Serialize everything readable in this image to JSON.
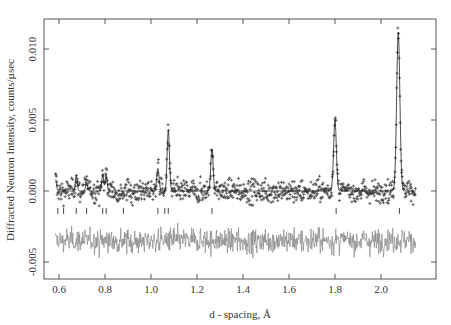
{
  "chart_data": {
    "type": "scatter",
    "title": "",
    "xlabel": "d - spacing, Å",
    "ylabel": "Diffracted Neutron Intensity, counts/µsec",
    "xlim": [
      0.57,
      2.18
    ],
    "ylim": [
      -0.0062,
      0.0121
    ],
    "x_ticks": [
      0.6,
      0.8,
      1.0,
      1.2,
      1.4,
      1.6,
      1.8,
      2.0
    ],
    "x_tick_labels": [
      "0.6",
      "0.8",
      "1.0",
      "1.2",
      "1.4",
      "1.6",
      "1.8",
      "2.0"
    ],
    "y_ticks": [
      -0.005,
      0.0,
      0.005,
      0.01
    ],
    "y_tick_labels": [
      "-0.005",
      "0.000",
      "0.005",
      "0.010"
    ],
    "grid": false,
    "legend": null,
    "data_range": [
      0.585,
      2.15
    ],
    "background_level": 0.0,
    "noise_amplitude": 0.0004,
    "peaks": [
      {
        "d": 0.585,
        "height": 0.0008,
        "width": 0.004
      },
      {
        "d": 0.675,
        "height": 0.0011,
        "width": 0.004
      },
      {
        "d": 0.72,
        "height": 0.0006,
        "width": 0.004
      },
      {
        "d": 0.79,
        "height": 0.0012,
        "width": 0.004
      },
      {
        "d": 0.805,
        "height": 0.0012,
        "width": 0.004
      },
      {
        "d": 1.03,
        "height": 0.0016,
        "width": 0.005
      },
      {
        "d": 1.075,
        "height": 0.0043,
        "width": 0.005
      },
      {
        "d": 1.265,
        "height": 0.003,
        "width": 0.005
      },
      {
        "d": 1.8,
        "height": 0.005,
        "width": 0.006
      },
      {
        "d": 2.075,
        "height": 0.0112,
        "width": 0.007
      }
    ],
    "series": [
      {
        "name": "observed",
        "style": "plus-markers",
        "color": "#3e3e3e"
      },
      {
        "name": "calculated",
        "style": "line",
        "color": "#222222"
      },
      {
        "name": "difference",
        "style": "line",
        "color": "#8a8a8a",
        "offset": -0.0035
      },
      {
        "name": "reflection-ticks",
        "style": "vertical-ticks",
        "y": -0.0014,
        "positions": [
          0.595,
          0.62,
          0.675,
          0.72,
          0.79,
          0.805,
          0.88,
          1.03,
          1.06,
          1.075,
          1.265,
          1.805,
          2.08
        ]
      }
    ]
  }
}
